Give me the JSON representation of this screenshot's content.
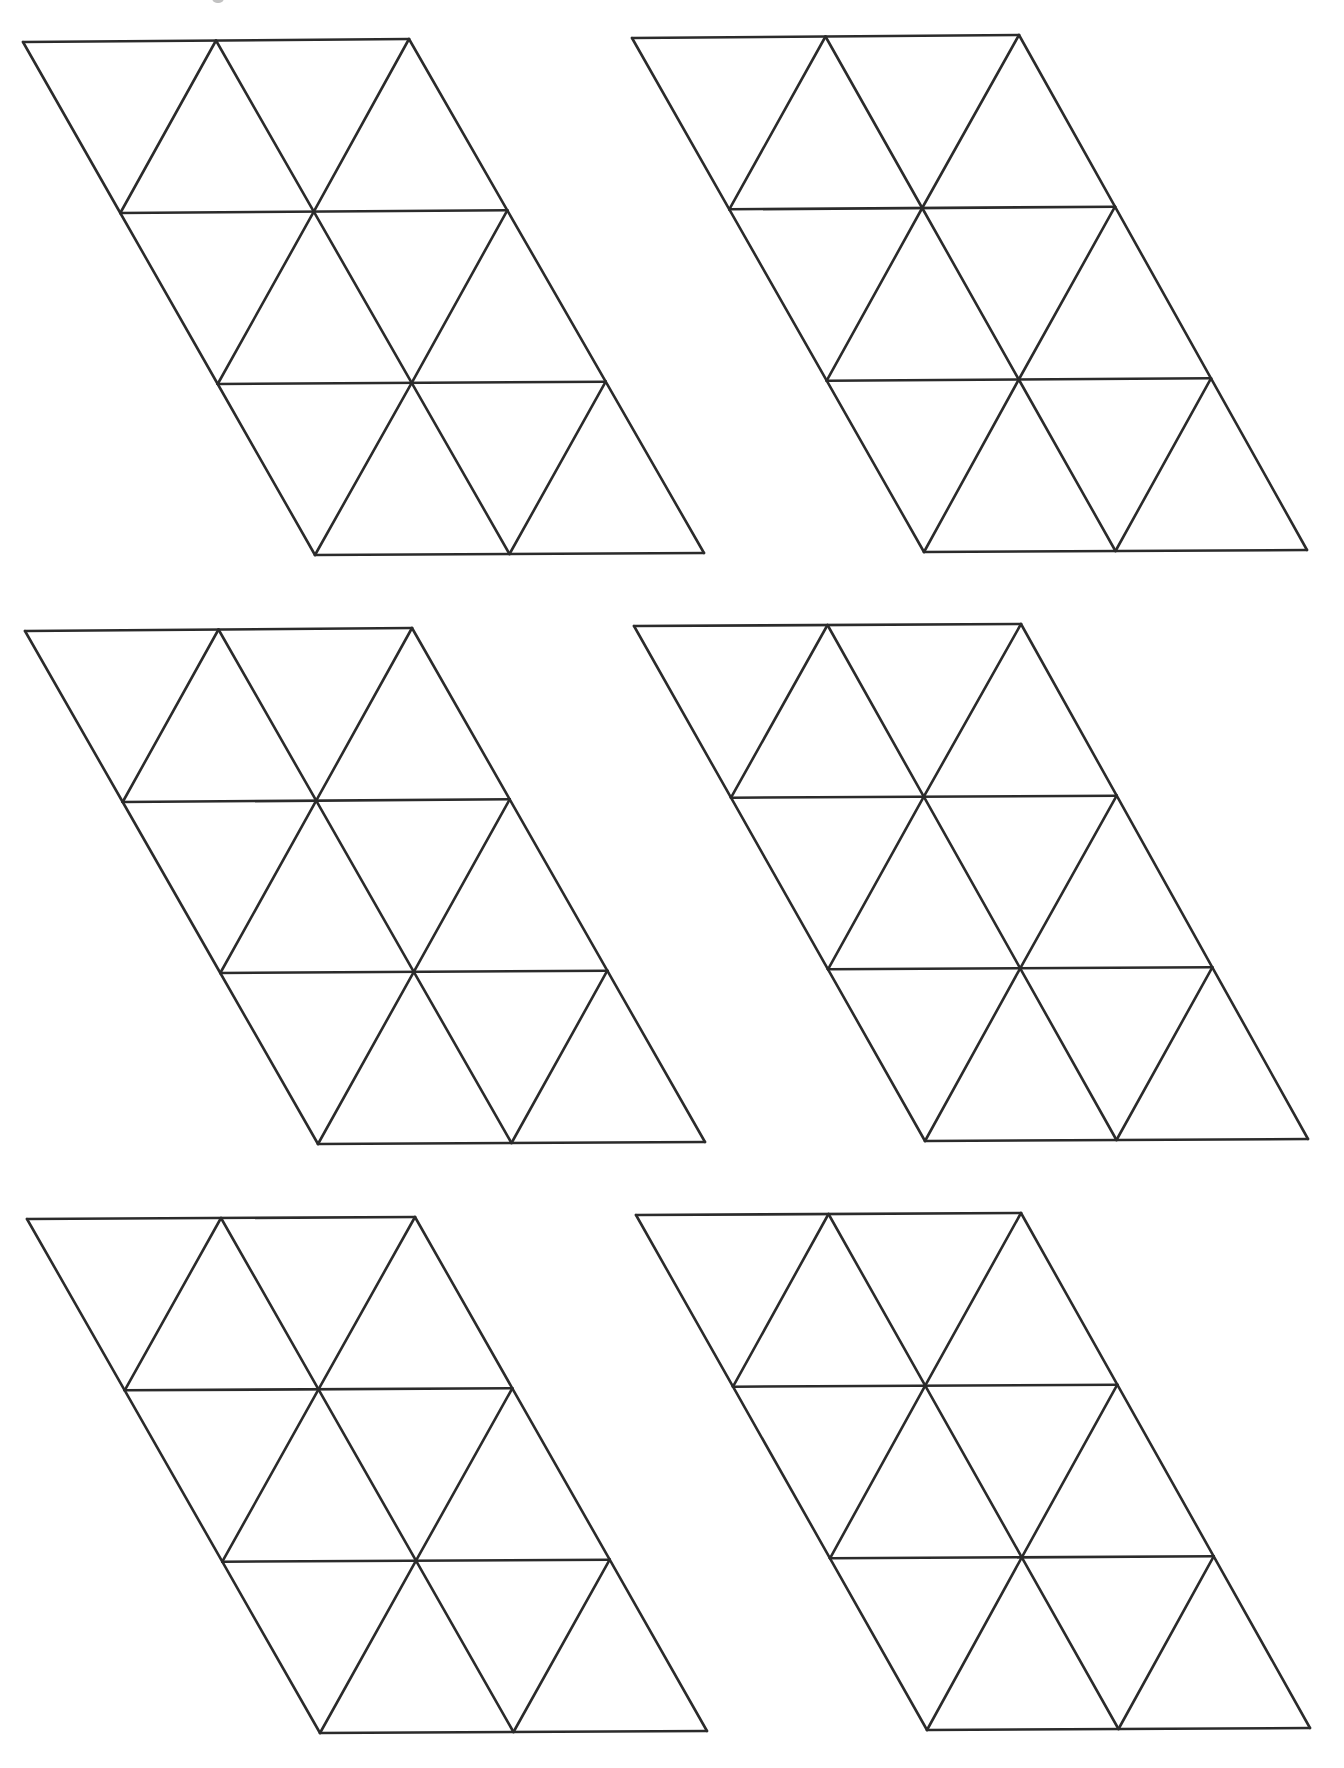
{
  "page": {
    "background": "#ffffff",
    "stroke_color": "#2b2b2b",
    "stroke_width": 2.6
  },
  "grid": {
    "rows": 3,
    "cols": 2,
    "description": "Six parallelogram strips, each divided into 3 rows of 2 rhombi, each rhombus split into 2 equilateral triangles (18 triangles per panel)"
  },
  "panels": [
    {
      "id": "panel-top-left",
      "tl": [
        23,
        42
      ],
      "tr": [
        409,
        39
      ],
      "bl": [
        315,
        555
      ],
      "br": [
        704,
        553
      ]
    },
    {
      "id": "panel-top-right",
      "tl": [
        632,
        38
      ],
      "tr": [
        1019,
        35
      ],
      "bl": [
        924,
        552
      ],
      "br": [
        1307,
        550
      ]
    },
    {
      "id": "panel-middle-left",
      "tl": [
        25,
        631
      ],
      "tr": [
        412,
        628
      ],
      "bl": [
        318,
        1144
      ],
      "br": [
        705,
        1142
      ]
    },
    {
      "id": "panel-middle-right",
      "tl": [
        634,
        626
      ],
      "tr": [
        1021,
        624
      ],
      "bl": [
        925,
        1141
      ],
      "br": [
        1308,
        1139
      ]
    },
    {
      "id": "panel-bottom-left",
      "tl": [
        27,
        1219
      ],
      "tr": [
        415,
        1217
      ],
      "bl": [
        320,
        1733
      ],
      "br": [
        707,
        1731
      ]
    },
    {
      "id": "panel-bottom-right",
      "tl": [
        636,
        1215
      ],
      "tr": [
        1021,
        1213
      ],
      "bl": [
        927,
        1730
      ],
      "br": [
        1310,
        1728
      ]
    }
  ]
}
